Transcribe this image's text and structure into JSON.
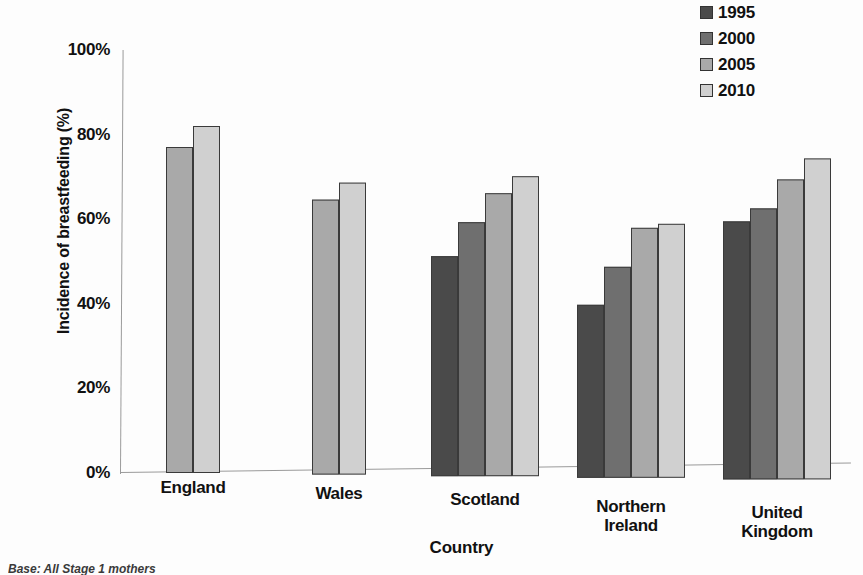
{
  "chart_data": {
    "type": "bar",
    "title": "",
    "xlabel": "Country",
    "ylabel": "Incidence of breastfeeding (%)",
    "categories": [
      "England",
      "Wales",
      "Scotland",
      "Northern Ireland",
      "United Kingdom"
    ],
    "series": [
      {
        "name": "1995",
        "color": "#4a4a4a",
        "values": [
          null,
          null,
          52,
          41,
          61
        ]
      },
      {
        "name": "2000",
        "color": "#6f6f6f",
        "values": [
          null,
          null,
          60,
          50,
          64
        ]
      },
      {
        "name": "2005",
        "color": "#a9a9a9",
        "values": [
          77,
          65,
          67,
          59,
          71
        ]
      },
      {
        "name": "2010",
        "color": "#d0d0d0",
        "values": [
          82,
          69,
          71,
          60,
          76
        ]
      }
    ],
    "ylim": [
      0,
      100
    ],
    "yticks": [
      "0%",
      "20%",
      "40%",
      "60%",
      "80%",
      "100%"
    ],
    "ytick_values": [
      0,
      20,
      40,
      60,
      80,
      100
    ],
    "grid": false,
    "legend_position": "top-right"
  },
  "legend": {
    "items": [
      {
        "label": "1995",
        "color": "#4a4a4a"
      },
      {
        "label": "2000",
        "color": "#6f6f6f"
      },
      {
        "label": "2005",
        "color": "#a9a9a9"
      },
      {
        "label": "2010",
        "color": "#d0d0d0"
      }
    ]
  },
  "axes": {
    "y_title": "Incidence of breastfeeding (%)",
    "x_title": "Country"
  },
  "footnote": "Base: All Stage 1 mothers"
}
